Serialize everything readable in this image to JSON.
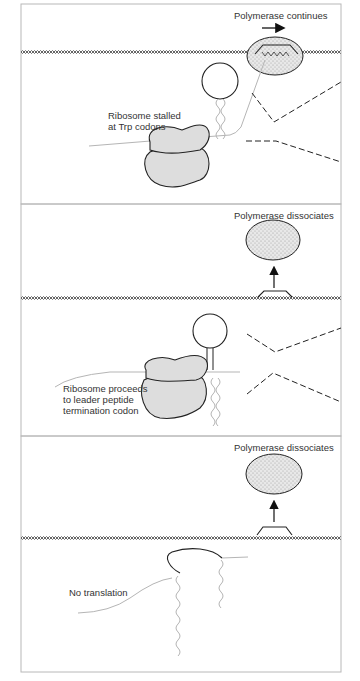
{
  "figure": {
    "type": "trp operon attenuation diagram",
    "panels": [
      {
        "id": "panel-1",
        "labels": {
          "polymerase": "Polymerase continues",
          "ribosome": [
            "Ribosome stalled",
            "at Trp codons"
          ]
        },
        "polymerase_state": "bound, moving right",
        "arrow_direction": "right"
      },
      {
        "id": "panel-2",
        "labels": {
          "polymerase": "Polymerase dissociates",
          "ribosome": [
            "Ribosome proceeds",
            "to leader peptide",
            "termination codon"
          ]
        },
        "polymerase_state": "released",
        "arrow_direction": "up"
      },
      {
        "id": "panel-3",
        "labels": {
          "polymerase": "Polymerase dissociates",
          "translation": "No translation"
        },
        "polymerase_state": "released",
        "arrow_direction": "up"
      }
    ]
  },
  "colors": {
    "frame": "#b8b8b8",
    "ribosome_fill": "#dddddd",
    "outline": "#222222",
    "mrna": "#b5b5b5"
  }
}
